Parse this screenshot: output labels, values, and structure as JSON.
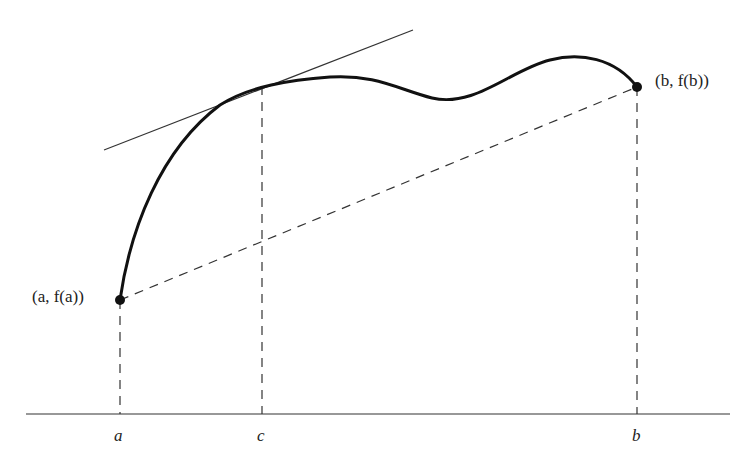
{
  "figure": {
    "colors": {
      "curve": "#111111",
      "lines": "#333333",
      "background": "#ffffff"
    },
    "labels": {
      "point_a": "(a, f(a))",
      "point_b": "(b, f(b))",
      "tick_a": "a",
      "tick_c": "c",
      "tick_b": "b"
    },
    "elements": {
      "curve": "f(x) from a to b",
      "secant": "dashed line from (a, f(a)) to (b, f(b))",
      "tangent": "tangent line at c parallel to secant",
      "verticals": [
        "x = a",
        "x = c",
        "x = b"
      ]
    }
  }
}
